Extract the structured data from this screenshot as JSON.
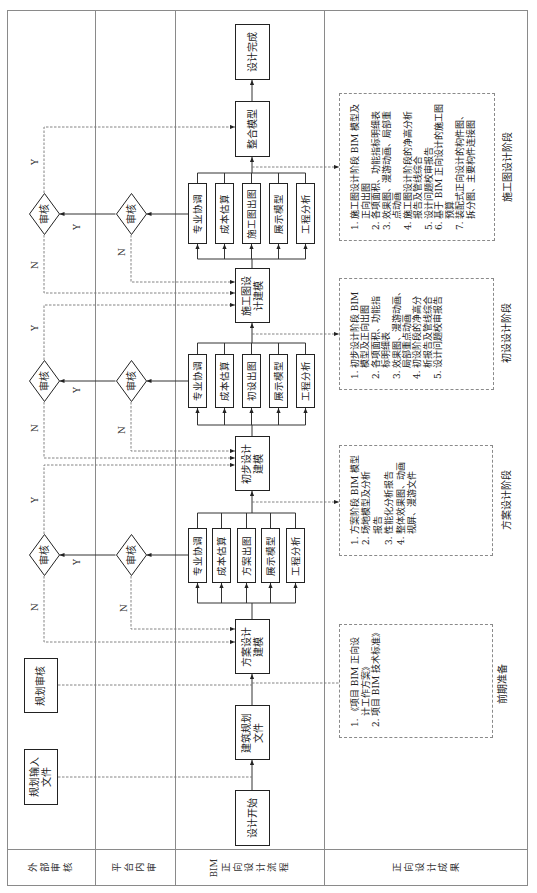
{
  "lanes": {
    "external_review": "外部审核",
    "platform_review": "平台内审",
    "bim_flow_prefix": "BIM",
    "bim_flow": "正向设计流程",
    "deliverables": "正向设计成果"
  },
  "external": {
    "planning_input": [
      "规划输入",
      "文件"
    ],
    "planning_review": "规划审核"
  },
  "flow": {
    "start": "设计开始",
    "planning_doc": [
      "建筑规划",
      "文件"
    ],
    "stages": [
      {
        "modeling": [
          "方案设计",
          "建模"
        ],
        "tasks": [
          "专业协调",
          "成本估算",
          "方案出图",
          "展示模型",
          "工程分析"
        ]
      },
      {
        "modeling": [
          "初步设计",
          "建模"
        ],
        "tasks": [
          "专业协调",
          "成本估算",
          "初设出图",
          "展示模型",
          "工程分析"
        ]
      },
      {
        "modeling": [
          "施工图设",
          "计建模"
        ],
        "tasks": [
          "专业协调",
          "成本估算",
          "施工图出图",
          "展示模型",
          "工程分析"
        ]
      }
    ],
    "integrate": "整合模型",
    "finish": "设计完成"
  },
  "review": {
    "label": "审核",
    "yes": "Y",
    "no": "N"
  },
  "deliverables": [
    {
      "stage": "前期准备",
      "items": [
        {
          "num": "1.",
          "lines": [
            "《项目 BIM 正向设",
            "计工作方案》"
          ]
        },
        {
          "num": "2.",
          "lines": [
            "项目 BIM 技术标准》"
          ]
        }
      ]
    },
    {
      "stage": "方案设计阶段",
      "items": [
        {
          "num": "1.",
          "lines": [
            "方案阶段 BIM 模型"
          ]
        },
        {
          "num": "2.",
          "lines": [
            "场地模型及分析",
            "报告"
          ]
        },
        {
          "num": "3.",
          "lines": [
            "性能化分析报告"
          ]
        },
        {
          "num": "4.",
          "lines": [
            "整体效果图、动画",
            "视屏、漫游文件"
          ]
        }
      ]
    },
    {
      "stage": "初设设计阶段",
      "items": [
        {
          "num": "1.",
          "lines": [
            "初步设计阶段 BIM",
            "模型及正向出图"
          ]
        },
        {
          "num": "2.",
          "lines": [
            "各项面积、功能指",
            "标明细表"
          ]
        },
        {
          "num": "3.",
          "lines": [
            "效果图、漫游动画、",
            "局部重点动画"
          ]
        },
        {
          "num": "4.",
          "lines": [
            "初设阶段的净高分",
            "析报告及管线综合"
          ]
        },
        {
          "num": "5.",
          "lines": [
            "设计问题校审报告"
          ]
        }
      ]
    },
    {
      "stage": "施工图设计阶段",
      "items": [
        {
          "num": "1.",
          "lines": [
            "施工图设计阶段 BIM 模型及",
            "正向出图"
          ]
        },
        {
          "num": "2.",
          "lines": [
            "各项面积、功能指标明细表"
          ]
        },
        {
          "num": "3.",
          "lines": [
            "效果图、漫游动画、局部重",
            "点动画"
          ]
        },
        {
          "num": "4.",
          "lines": [
            "施工图设计阶段的净高分析",
            "报告及管线综合"
          ]
        },
        {
          "num": "5.",
          "lines": [
            "设计问题校审报告"
          ]
        },
        {
          "num": "6.",
          "lines": [
            "基于 BIM 正向设计的施工图",
            "预算"
          ]
        },
        {
          "num": "7.",
          "lines": [
            "装配式正向设计的构件图、",
            "拆分图、主要构件连接图"
          ]
        }
      ]
    }
  ]
}
